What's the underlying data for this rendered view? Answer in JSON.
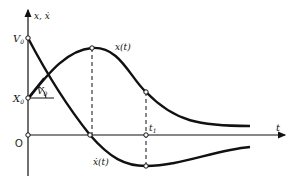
{
  "diagram": {
    "y_axis_label": "x, ẋ",
    "x_axis_label": "t",
    "origin_label": "O",
    "v0_label": "V",
    "v0_sub": "0",
    "x0_label": "X",
    "x0_sub": "0",
    "angle_label": "V",
    "angle_sub": "0",
    "t1_label": "t",
    "t1_sub": "1",
    "curve_x_label": "x(t)",
    "curve_xdot_label": "ẋ(t)"
  },
  "colors": {
    "ink": "#111111",
    "background": "#ffffff"
  }
}
